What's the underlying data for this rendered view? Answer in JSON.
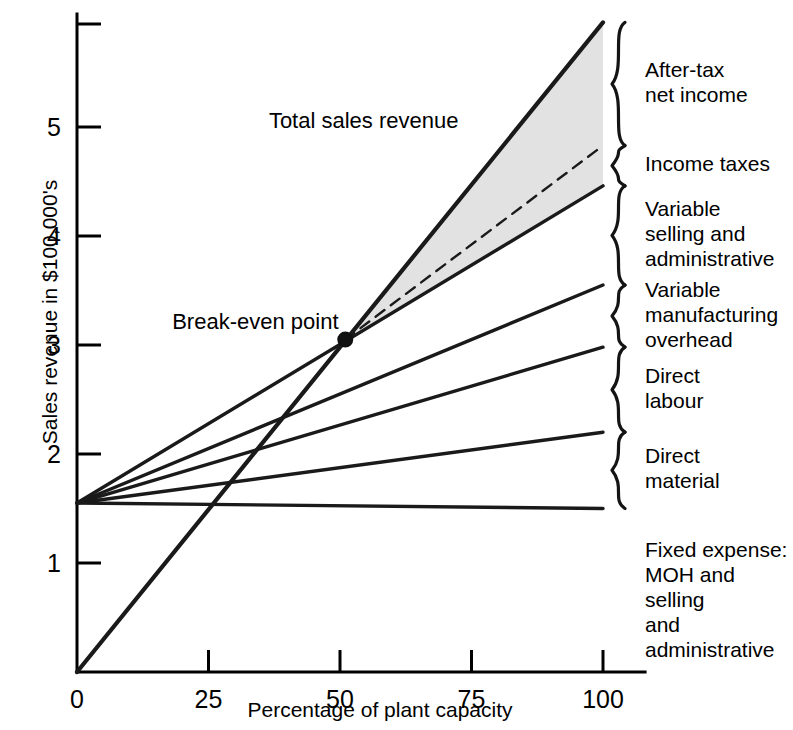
{
  "chart_data": {
    "type": "line",
    "title": "",
    "xlabel": "Percentage of plant capacity",
    "ylabel": "Sales revenue in $100,000's",
    "xlim": [
      0,
      108
    ],
    "ylim": [
      0,
      6.0
    ],
    "xticks": [
      0,
      25,
      50,
      75,
      100
    ],
    "xtick_labels": [
      "0",
      "25",
      "50",
      "75",
      "100"
    ],
    "yticks": [
      1,
      2,
      3,
      4,
      5
    ],
    "ytick_labels": [
      "1",
      "2",
      "3",
      "4",
      "5"
    ],
    "grid": false,
    "legend_position": "right-braces",
    "fixed_expense_level": 1.55,
    "break_even": {
      "x": 51,
      "y": 3.05,
      "label": "Break-even point"
    },
    "series": [
      {
        "name": "Total sales revenue",
        "style": "solid-thick",
        "x": [
          0,
          100
        ],
        "y": [
          0,
          5.96
        ]
      },
      {
        "name": "Income taxes boundary (after-tax net income lower bound)",
        "style": "dashed",
        "x": [
          51,
          100
        ],
        "y": [
          3.05,
          4.83
        ]
      },
      {
        "name": "Variable selling and administrative",
        "style": "solid",
        "x": [
          0,
          100
        ],
        "y": [
          1.55,
          4.46
        ]
      },
      {
        "name": "Variable manufacturing overhead",
        "style": "solid",
        "x": [
          0,
          100
        ],
        "y": [
          1.55,
          3.55
        ]
      },
      {
        "name": "Direct labour",
        "style": "solid",
        "x": [
          0,
          100
        ],
        "y": [
          1.55,
          2.98
        ]
      },
      {
        "name": "Direct material",
        "style": "solid",
        "x": [
          0,
          100
        ],
        "y": [
          1.55,
          2.2
        ]
      },
      {
        "name": "Fixed expense: MOH and selling and administrative",
        "style": "solid",
        "x": [
          0,
          100
        ],
        "y": [
          1.55,
          1.5
        ]
      }
    ],
    "shaded_region": {
      "name": "After-tax net income and income taxes wedge",
      "color": "#e2e2e2",
      "description": "Area between total sales revenue line and variable selling and administrative line, right of break-even point"
    },
    "annotations": [
      {
        "text": "Total sales revenue",
        "x": 38,
        "y": 5.05
      },
      {
        "text": "Break-even point",
        "x": 20,
        "y": 3.2
      }
    ],
    "legend_braces": [
      {
        "label": "After-tax\nnet income",
        "top_y": 5.96,
        "bottom_y": 4.83
      },
      {
        "label": "Income taxes",
        "top_y": 4.83,
        "bottom_y": 4.46
      },
      {
        "label": "Variable\nselling and\nadministrative",
        "top_y": 4.46,
        "bottom_y": 3.55
      },
      {
        "label": "Variable\nmanufacturing\noverhead",
        "top_y": 3.55,
        "bottom_y": 2.98
      },
      {
        "label": "Direct\nlabour",
        "top_y": 2.98,
        "bottom_y": 2.2
      },
      {
        "label": "Direct\nmaterial",
        "top_y": 2.2,
        "bottom_y": 1.5
      }
    ],
    "footnote": "Fixed expense:\nMOH and selling\nand administrative"
  },
  "axes": {
    "y_title": "Sales revenue in $100,000's",
    "x_title": "Percentage of plant capacity",
    "x_tick_labels": [
      "0",
      "25",
      "50",
      "75",
      "100"
    ],
    "y_tick_labels": [
      "1",
      "2",
      "3",
      "4",
      "5"
    ]
  },
  "labels": {
    "total_sales_revenue": "Total sales revenue",
    "break_even_point": "Break-even point",
    "after_tax_net_income": "After-tax\nnet income",
    "income_taxes": "Income taxes",
    "variable_selling_admin": "Variable\nselling and\nadministrative",
    "variable_manufacturing_overhead": "Variable\nmanufacturing\noverhead",
    "direct_labour": "Direct\nlabour",
    "direct_material": "Direct\nmaterial",
    "fixed_expense": "Fixed expense:\nMOH and selling\nand administrative"
  }
}
